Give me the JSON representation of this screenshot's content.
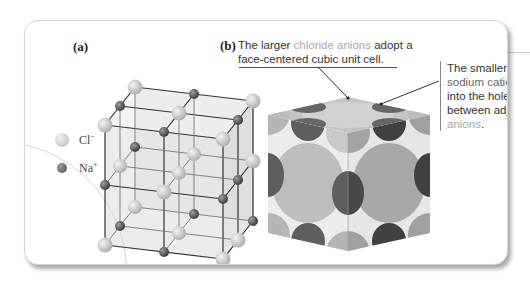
{
  "figure": {
    "panel_a": {
      "label": "(a)",
      "description": "Ball-and-stick 3x3x3 lattice of alternating Cl⁻ and Na⁺ ions",
      "legend": [
        {
          "symbol": "Cl",
          "charge": "−",
          "ion": "chloride",
          "swatch_color": "#c8c8c8",
          "size": "large"
        },
        {
          "symbol": "Na",
          "charge": "+",
          "ion": "sodium",
          "swatch_color": "#666666",
          "size": "small"
        }
      ]
    },
    "panel_b": {
      "label": "(b)",
      "caption_parts": {
        "before": "The larger ",
        "highlight": "chloride anions",
        "after": " adopt a face-centered cubic unit cell."
      },
      "description": "Space-filling model of NaCl unit cell"
    },
    "callout": {
      "line1": "The smaller",
      "highlight": "sodium cations",
      "line3": "fit into the holes between adjacent",
      "highlight2": "anions",
      "end": "."
    },
    "colors": {
      "chloride": "#c4c4c4",
      "sodium": "#5e5e5e",
      "highlight_text": "#a9a9a9",
      "panel_border": "#d6d6d6"
    }
  }
}
